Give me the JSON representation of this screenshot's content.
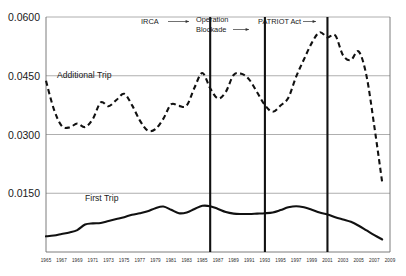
{
  "chart_data": {
    "type": "line",
    "title": "",
    "subtitle": "",
    "xlabel": "",
    "ylabel": "",
    "grid": true,
    "legend_position": "inline-annotations",
    "xlim": [
      1965,
      2009
    ],
    "ylim": [
      0,
      0.06
    ],
    "y_ticks": [
      "0.0600",
      "0.0450",
      "0.0300",
      "0.0150"
    ],
    "y_tick_values": [
      0.06,
      0.045,
      0.03,
      0.015
    ],
    "x_ticks": [
      "1965",
      "1967",
      "1969",
      "1971",
      "1973",
      "1975",
      "1977",
      "1979",
      "1981",
      "1983",
      "1985",
      "1987",
      "1989",
      "1991",
      "1993",
      "1995",
      "1997",
      "1999",
      "2001",
      "2003",
      "2005",
      "2007",
      "2009"
    ],
    "x_tick_values": [
      1965,
      1967,
      1969,
      1971,
      1973,
      1975,
      1977,
      1979,
      1981,
      1983,
      1985,
      1987,
      1989,
      1991,
      1993,
      1995,
      1997,
      1999,
      2001,
      2003,
      2005,
      2007,
      2009
    ],
    "series": [
      {
        "name": "Additional Trip",
        "style": "dashed",
        "color": "#111111",
        "x": [
          1965,
          1966,
          1967,
          1968,
          1969,
          1970,
          1971,
          1972,
          1973,
          1974,
          1975,
          1976,
          1977,
          1978,
          1979,
          1980,
          1981,
          1982,
          1983,
          1984,
          1985,
          1986,
          1987,
          1988,
          1989,
          1990,
          1991,
          1992,
          1993,
          1994,
          1995,
          1996,
          1997,
          1998,
          1999,
          2000,
          2001,
          2002,
          2003,
          2004,
          2005,
          2006,
          2007,
          2008
        ],
        "values": [
          0.0437,
          0.0365,
          0.0322,
          0.0318,
          0.0328,
          0.0319,
          0.034,
          0.0382,
          0.0372,
          0.0388,
          0.0404,
          0.0375,
          0.0336,
          0.031,
          0.0314,
          0.034,
          0.0377,
          0.0373,
          0.0374,
          0.042,
          0.0457,
          0.0418,
          0.0392,
          0.0409,
          0.0452,
          0.0455,
          0.044,
          0.0408,
          0.0375,
          0.0358,
          0.0374,
          0.0394,
          0.0448,
          0.0492,
          0.0534,
          0.0561,
          0.0548,
          0.0553,
          0.0502,
          0.049,
          0.0512,
          0.0449,
          0.032,
          0.0178
        ]
      },
      {
        "name": "First Trip",
        "style": "solid",
        "color": "#111111",
        "x": [
          1965,
          1966,
          1967,
          1968,
          1969,
          1970,
          1971,
          1972,
          1973,
          1974,
          1975,
          1976,
          1977,
          1978,
          1979,
          1980,
          1981,
          1982,
          1983,
          1984,
          1985,
          1986,
          1987,
          1988,
          1989,
          1990,
          1991,
          1992,
          1993,
          1994,
          1995,
          1996,
          1997,
          1998,
          1999,
          2000,
          2001,
          2002,
          2003,
          2004,
          2005,
          2006,
          2007,
          2008
        ],
        "values": [
          0.004,
          0.0042,
          0.0046,
          0.005,
          0.0056,
          0.007,
          0.0073,
          0.0074,
          0.0079,
          0.0084,
          0.0089,
          0.0095,
          0.0099,
          0.0104,
          0.0112,
          0.0116,
          0.0108,
          0.0099,
          0.0101,
          0.011,
          0.0118,
          0.0117,
          0.011,
          0.0102,
          0.0098,
          0.0097,
          0.0097,
          0.0098,
          0.0099,
          0.0101,
          0.0107,
          0.0114,
          0.0117,
          0.0114,
          0.0108,
          0.0101,
          0.0096,
          0.0089,
          0.0083,
          0.0077,
          0.0067,
          0.0055,
          0.0043,
          0.0032
        ]
      }
    ],
    "annotations": [
      {
        "id": "irca",
        "label": "IRCA",
        "year": 1986,
        "label_side": "left"
      },
      {
        "id": "operation-blockade",
        "label": "Operation Blockade",
        "label_line1": "Operation",
        "label_line2": "Blockade",
        "year": 1993,
        "label_side": "left"
      },
      {
        "id": "patriot-act",
        "label": "PATRIOT Act",
        "year": 2001,
        "label_side": "left"
      }
    ],
    "series_inline_labels": [
      {
        "id": "additional-trip",
        "text": "Additional Trip"
      },
      {
        "id": "first-trip",
        "text": "First Trip"
      }
    ]
  }
}
